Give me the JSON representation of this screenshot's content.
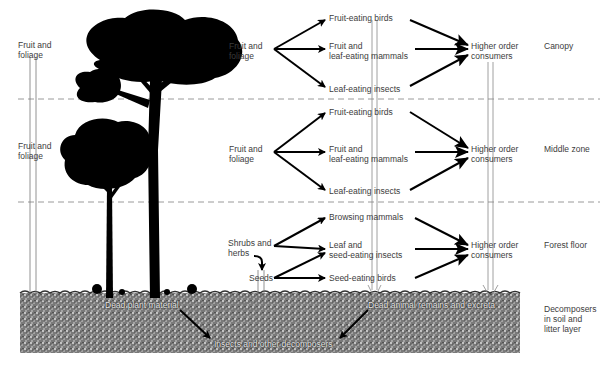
{
  "zones": [
    {
      "id": "canopy",
      "label": "Canopy"
    },
    {
      "id": "middle",
      "label": "Middle zone"
    },
    {
      "id": "floor",
      "label": "Forest floor"
    },
    {
      "id": "soil",
      "label": "Decomposers in soil and litter layer",
      "lines": [
        "Decomposers",
        "in soil and",
        "litter layer"
      ]
    }
  ],
  "left_labels": {
    "canopy": [
      "Fruit and",
      "foliage"
    ],
    "middle": [
      "Fruit and",
      "foliage"
    ]
  },
  "canopy": {
    "source": [
      "Fruit and",
      "foliage"
    ],
    "consumers": [
      {
        "lines": [
          "Fruit-eating birds"
        ]
      },
      {
        "lines": [
          "Fruit and",
          "leaf-eating mammals"
        ]
      },
      {
        "lines": [
          "Leaf-eating insects"
        ]
      }
    ],
    "top": [
      "Higher order",
      "consumers"
    ]
  },
  "middle": {
    "source": [
      "Fruit and",
      "foliage"
    ],
    "consumers": [
      {
        "lines": [
          "Fruit-eating birds"
        ]
      },
      {
        "lines": [
          "Fruit and",
          "leaf-eating mammals"
        ]
      },
      {
        "lines": [
          "Leaf-eating insects"
        ]
      }
    ],
    "top": [
      "Higher order",
      "consumers"
    ]
  },
  "floor": {
    "source": [
      "Shrubs and",
      "herbs"
    ],
    "seeds": "Seeds",
    "consumers": [
      {
        "lines": [
          "Browsing mammals"
        ]
      },
      {
        "lines": [
          "Leaf and",
          "seed-eating insects"
        ]
      },
      {
        "lines": [
          "Seed-eating birds"
        ]
      }
    ],
    "top": [
      "Higher order",
      "consumers"
    ]
  },
  "soil": {
    "dead_plant": "Dead plant material",
    "dead_animal": "Dead animal remains and excreta",
    "decomposers": "Insects and other decomposers"
  },
  "colors": {
    "ink": "#000000",
    "text": "#3c3c3c",
    "dashed": "#9a9a9a",
    "soil": "#8a8a8a"
  }
}
